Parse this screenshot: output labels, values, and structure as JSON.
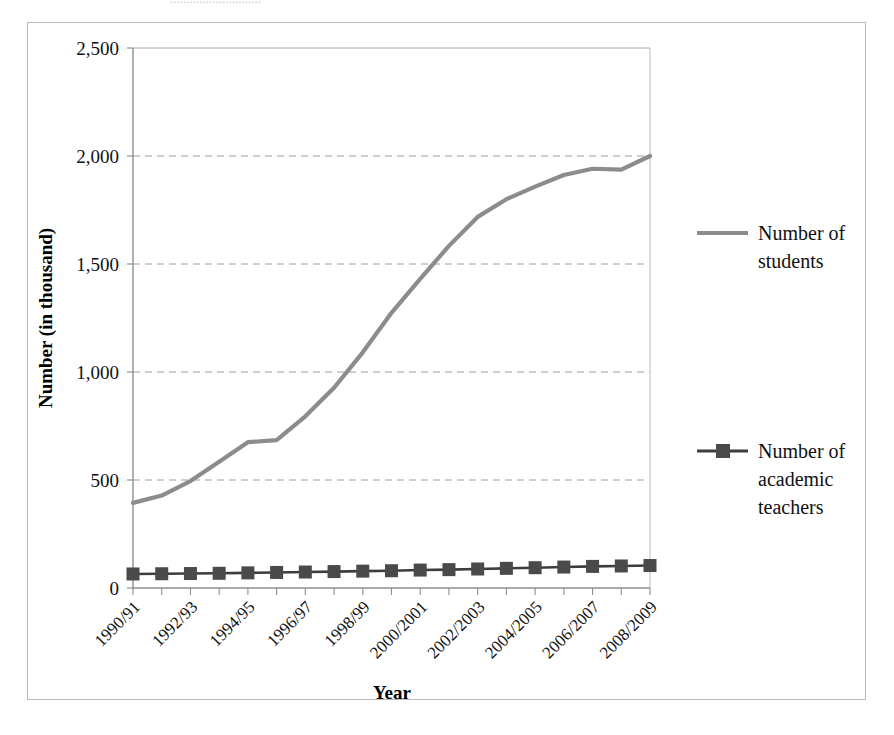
{
  "top_sliver_text": "............................",
  "chart_data": {
    "type": "line",
    "title": "",
    "xlabel": "Year",
    "ylabel": "Number (in thousand)",
    "ylim": [
      0,
      2500
    ],
    "yticks": [
      0,
      500,
      1000,
      1500,
      2000,
      2500
    ],
    "ytick_labels": [
      "0",
      "500",
      "1,000",
      "1,500",
      "2,000",
      "2,500"
    ],
    "grid": "horizontal-dashed",
    "legend_position": "right",
    "categories": [
      "1990/91",
      "1991/92",
      "1992/93",
      "1993/94",
      "1994/95",
      "1995/96",
      "1996/97",
      "1997/98",
      "1998/99",
      "1999/2000",
      "2000/2001",
      "2001/2002",
      "2002/2003",
      "2003/2004",
      "2004/2005",
      "2005/2006",
      "2006/2007",
      "2007/2008",
      "2008/2009"
    ],
    "xtick_labels_shown": [
      "1990/91",
      "1992/93",
      "1994/95",
      "1996/97",
      "1998/99",
      "2000/2001",
      "2002/2003",
      "2004/2005",
      "2006/2007",
      "2008/2009"
    ],
    "series": [
      {
        "name": "Number of students",
        "color": "#8c8c8c",
        "marker": "none",
        "values": [
          394,
          428,
          495,
          585,
          675,
          685,
          795,
          927,
          1091,
          1274,
          1431,
          1584,
          1718,
          1800,
          1858,
          1912,
          1941,
          1937,
          2000
        ]
      },
      {
        "name": "Number of academic teachers",
        "color": "#4a4a4a",
        "marker": "square",
        "values": [
          65,
          66,
          67,
          68,
          70,
          72,
          74,
          76,
          78,
          80,
          83,
          85,
          88,
          91,
          94,
          97,
          100,
          102,
          104
        ]
      }
    ]
  },
  "legend": {
    "items": [
      {
        "label_line1": "Number of",
        "label_line2": "students",
        "label_line3": ""
      },
      {
        "label_line1": "Number of",
        "label_line2": "academic",
        "label_line3": "teachers"
      }
    ]
  }
}
